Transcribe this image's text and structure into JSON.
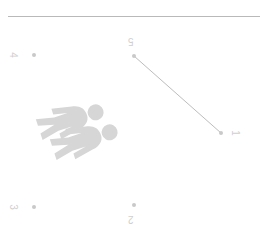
{
  "canvas": {
    "width": 260,
    "height": 238,
    "background": "#ffffff"
  },
  "separator": {
    "name": "top-horizontal-rule",
    "color": "#b9b9b9"
  },
  "palette": {
    "rule": "#b9b9b9",
    "marker": "#c9c9c9",
    "label_text": "#cfcfcf",
    "connector": "#bdbdbd",
    "pictogram": "#d6d6d6",
    "background": "#ffffff"
  },
  "points": [
    {
      "id": "p5",
      "label": "5",
      "x": 134,
      "y": 56,
      "rotation_deg": 180
    },
    {
      "id": "p4",
      "label": "4",
      "x": 34,
      "y": 55,
      "rotation_deg": 90
    },
    {
      "id": "p3",
      "label": "3",
      "x": 34,
      "y": 207,
      "rotation_deg": 90
    },
    {
      "id": "p2",
      "label": "2",
      "x": 134,
      "y": 205,
      "rotation_deg": 180
    },
    {
      "id": "p1",
      "label": "1",
      "x": 221,
      "y": 133,
      "rotation_deg": 90
    }
  ],
  "connector": {
    "name": "connector-5-to-1",
    "from": "5",
    "to": "1",
    "x1": 134,
    "y1": 56,
    "x2": 221,
    "y2": 133,
    "color": "#bdbdbd",
    "width": 1
  },
  "pictograms": [
    {
      "id": "person-a",
      "kind": "pedestrian",
      "rotation_deg": 72,
      "color": "#d6d6d6"
    },
    {
      "id": "person-b",
      "kind": "pedestrian",
      "rotation_deg": 72,
      "color": "#d6d6d6"
    }
  ]
}
